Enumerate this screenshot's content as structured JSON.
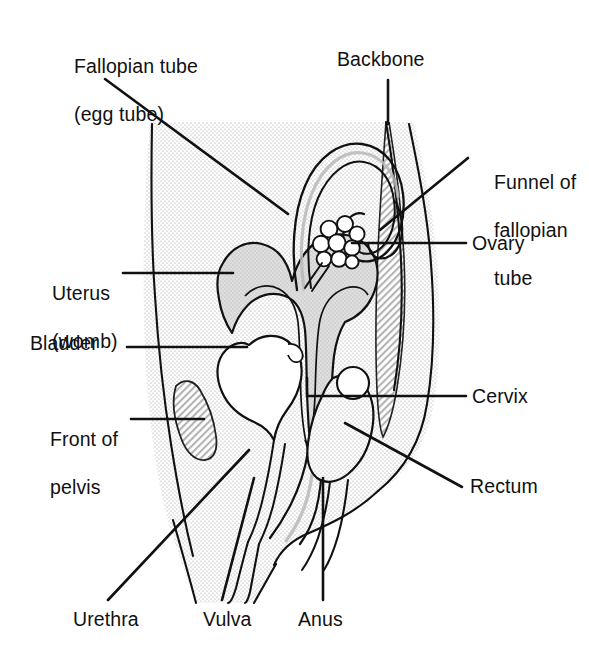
{
  "figure": {
    "background_color": "#ffffff",
    "ink_color": "#111111",
    "body_fill_color": "#ebebeb",
    "organ_fill_color": "#d9d9d9",
    "hatch_color": "#bdbdbd",
    "width": 589,
    "height": 669
  },
  "labels": {
    "fallopian_tube_line1": "Fallopian tube",
    "fallopian_tube_line2": "(egg tube)",
    "backbone": "Backbone",
    "funnel_line1": "Funnel of",
    "funnel_line2": "fallopian",
    "funnel_line3": "tube",
    "ovary": "Ovary",
    "uterus_line1": "Uterus",
    "uterus_line2": "(womb)",
    "bladder": "Bladder",
    "front_of_pelvis_line1": "Front of",
    "front_of_pelvis_line2": "pelvis",
    "cervix": "Cervix",
    "rectum": "Rectum",
    "urethra": "Urethra",
    "vulva": "Vulva",
    "anus": "Anus"
  },
  "parts": [
    {
      "name": "fallopian-tube",
      "label": "Fallopian tube (egg tube)",
      "side": "left"
    },
    {
      "name": "backbone",
      "label": "Backbone",
      "side": "top"
    },
    {
      "name": "funnel-of-fallopian-tube",
      "label": "Funnel of fallopian tube",
      "side": "right"
    },
    {
      "name": "ovary",
      "label": "Ovary",
      "side": "right"
    },
    {
      "name": "uterus",
      "label": "Uterus (womb)",
      "side": "left"
    },
    {
      "name": "bladder",
      "label": "Bladder",
      "side": "left"
    },
    {
      "name": "front-of-pelvis",
      "label": "Front of pelvis",
      "side": "left"
    },
    {
      "name": "cervix",
      "label": "Cervix",
      "side": "right"
    },
    {
      "name": "rectum",
      "label": "Rectum",
      "side": "right"
    },
    {
      "name": "urethra",
      "label": "Urethra",
      "side": "bottom"
    },
    {
      "name": "vulva",
      "label": "Vulva",
      "side": "bottom"
    },
    {
      "name": "anus",
      "label": "Anus",
      "side": "bottom"
    }
  ]
}
